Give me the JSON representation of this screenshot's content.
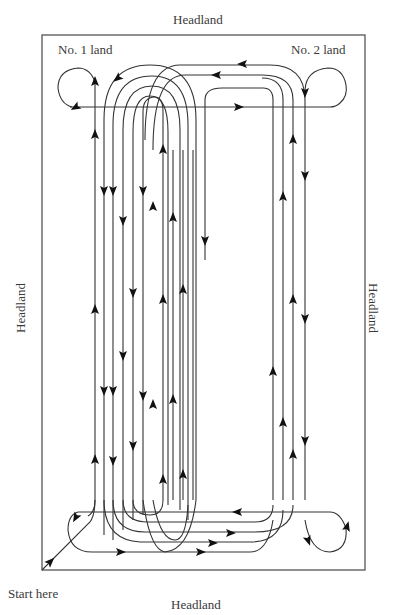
{
  "diagram": {
    "labels": {
      "headland_top": "Headland",
      "headland_bottom": "Headland",
      "headland_left": "Headland",
      "headland_right": "Headland",
      "land_1": "No. 1 land",
      "land_2": "No. 2 land",
      "start": "Start here"
    },
    "colors": {
      "border": "#555555",
      "path": "#333333",
      "arrow": "#111111",
      "background": "#ffffff"
    },
    "field_border": {
      "x": 42,
      "y": 35,
      "width": 323,
      "height": 535
    },
    "vertical_furrows_x_land1": [
      95,
      104,
      113,
      123,
      133,
      143,
      153,
      163,
      173,
      183,
      193,
      205
    ],
    "vertical_furrows_x_land2": [
      273,
      283,
      293,
      305
    ],
    "headland_lines_y": {
      "top": 107,
      "bottom": 512
    }
  }
}
